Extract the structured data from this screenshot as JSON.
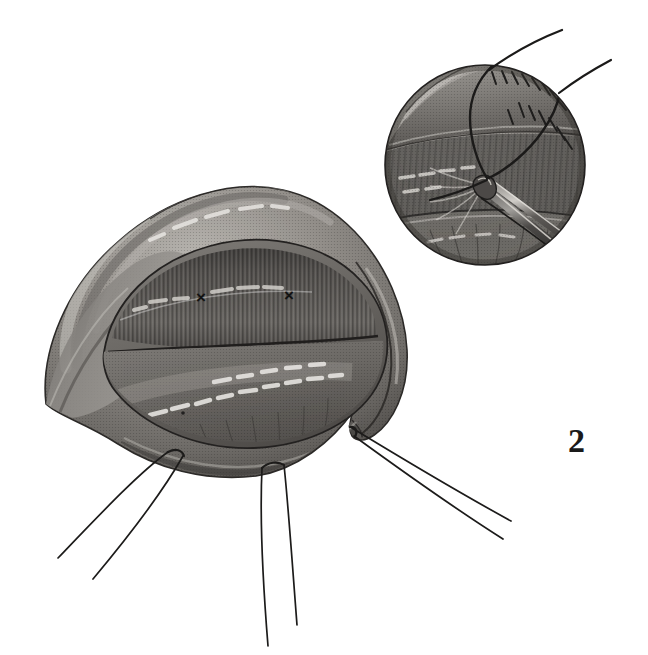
{
  "figure": {
    "number": "2",
    "domain": "surgical-illustration",
    "medium": "halftone engraving, grayscale",
    "background_color": "#ffffff",
    "ink_color": "#1a1a1a",
    "canvas": {
      "width": 648,
      "height": 655
    }
  },
  "main_illustration": {
    "name": "tissue-flap-with-retained-sutures",
    "description": "Opened shield-shaped tissue flap seen from above, with everted lip edges, a transverse incision line and a striated mucosal surface",
    "bounds": {
      "x": 34,
      "y": 182,
      "width": 390,
      "height": 300
    },
    "tone_stops": [
      "#efeeec",
      "#cfcdc9",
      "#a9a6a1",
      "#858380",
      "#625f5c",
      "#403e3c",
      "#262424"
    ],
    "markers": [
      {
        "label": "×",
        "name": "suture-site-mark-left",
        "x": 201,
        "y": 297
      },
      {
        "label": "×",
        "name": "suture-site-mark-right",
        "x": 289,
        "y": 295
      }
    ],
    "anatomy_regions": [
      {
        "name": "outer-rim",
        "tone": "#8b8884"
      },
      {
        "name": "inner-bed-upper-striated",
        "tone": "#5e5b58"
      },
      {
        "name": "inner-bed-lower-smooth",
        "tone": "#6f6c68"
      },
      {
        "name": "incision-line",
        "tone": "#2a2826"
      }
    ]
  },
  "sutures": {
    "count_visible": 6,
    "color": "#1c1b1a",
    "groups": [
      {
        "name": "suture-pair-left",
        "anchor": {
          "x": 167,
          "y": 452
        },
        "strands": [
          {
            "name": "suture-strand-left-a",
            "from": [
              167,
              452
            ],
            "to": [
              56,
              558
            ]
          },
          {
            "name": "suture-strand-left-b",
            "from": [
              182,
              456
            ],
            "to": [
              92,
              578
            ]
          }
        ]
      },
      {
        "name": "suture-pair-center",
        "anchor": {
          "x": 268,
          "y": 468
        },
        "strands": [
          {
            "name": "suture-strand-center-a",
            "from": [
              263,
              468
            ],
            "to": [
              268,
              646
            ]
          },
          {
            "name": "suture-strand-center-b",
            "from": [
              283,
              466
            ],
            "to": [
              296,
              625
            ]
          }
        ]
      },
      {
        "name": "suture-pair-right",
        "anchor": {
          "x": 353,
          "y": 428
        },
        "strands": [
          {
            "name": "suture-strand-right-a",
            "from": [
              353,
              428
            ],
            "to": [
              510,
              521
            ]
          },
          {
            "name": "suture-strand-right-b",
            "from": [
              357,
              436
            ],
            "to": [
              503,
              538
            ]
          }
        ]
      }
    ]
  },
  "inset": {
    "name": "magnified-suture-placement-detail",
    "shape": "circle",
    "center": {
      "x": 485,
      "y": 165
    },
    "radius": 100,
    "description": "Close-up of a needle-driver/forceps grasping tissue while a suture loop is drawn through the everted edge",
    "tone_stops": [
      "#d8d6d2",
      "#b0adA8",
      "#8a8783",
      "#63605d",
      "#3a3836"
    ],
    "instrument": {
      "name": "forceps",
      "tip": {
        "x": 488,
        "y": 182
      },
      "shaft_end": {
        "x": 577,
        "y": 262
      },
      "color": "#4a4846"
    },
    "suture_tails": [
      {
        "name": "inset-suture-tail-upper-left",
        "from": [
          489,
          176
        ],
        "to": [
          561,
          33
        ]
      },
      {
        "name": "inset-suture-tail-upper-right",
        "from": [
          492,
          176
        ],
        "to": [
          608,
          60
        ]
      }
    ]
  },
  "caption": {
    "visible_text": "2"
  }
}
